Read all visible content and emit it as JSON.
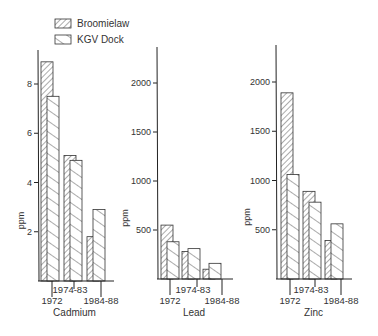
{
  "chart_data": [
    {
      "type": "bar",
      "title": "Cadmium",
      "xlabel": "Cadmium",
      "ylabel": "ppm",
      "categories": [
        "1972",
        "1974-83",
        "1984-88"
      ],
      "yticks": [
        2,
        4,
        6,
        8
      ],
      "ylim": [
        0,
        9.5
      ],
      "grid": false,
      "series": [
        {
          "name": "Broomielaw",
          "values": [
            8.9,
            5.1,
            1.8
          ]
        },
        {
          "name": "KGV Dock",
          "values": [
            7.5,
            4.9,
            2.9
          ]
        }
      ]
    },
    {
      "type": "bar",
      "title": "Lead",
      "xlabel": "Lead",
      "ylabel": "ppm",
      "categories": [
        "1972",
        "1974-83",
        "1984-88"
      ],
      "yticks": [
        500,
        1000,
        1500,
        2000
      ],
      "ylim": [
        0,
        2350
      ],
      "grid": false,
      "series": [
        {
          "name": "Broomielaw",
          "values": [
            550,
            280,
            100
          ]
        },
        {
          "name": "KGV Dock",
          "values": [
            380,
            310,
            160
          ]
        }
      ]
    },
    {
      "type": "bar",
      "title": "Zinc",
      "xlabel": "Zinc",
      "ylabel": "ppm",
      "categories": [
        "1972",
        "1974-83",
        "1984-88"
      ],
      "yticks": [
        500,
        1000,
        1500,
        2000
      ],
      "ylim": [
        0,
        2350
      ],
      "grid": false,
      "series": [
        {
          "name": "Broomielaw",
          "values": [
            1890,
            890,
            390
          ]
        },
        {
          "name": "KGV Dock",
          "values": [
            1060,
            780,
            560
          ]
        }
      ]
    }
  ],
  "legend": {
    "placement": "top-left",
    "items": [
      {
        "label": "Broomielaw",
        "pattern": "forward-hatch"
      },
      {
        "label": "KGV Dock",
        "pattern": "back-hatch"
      }
    ]
  },
  "colors": {
    "ink": "#333333",
    "background": "#ffffff"
  }
}
